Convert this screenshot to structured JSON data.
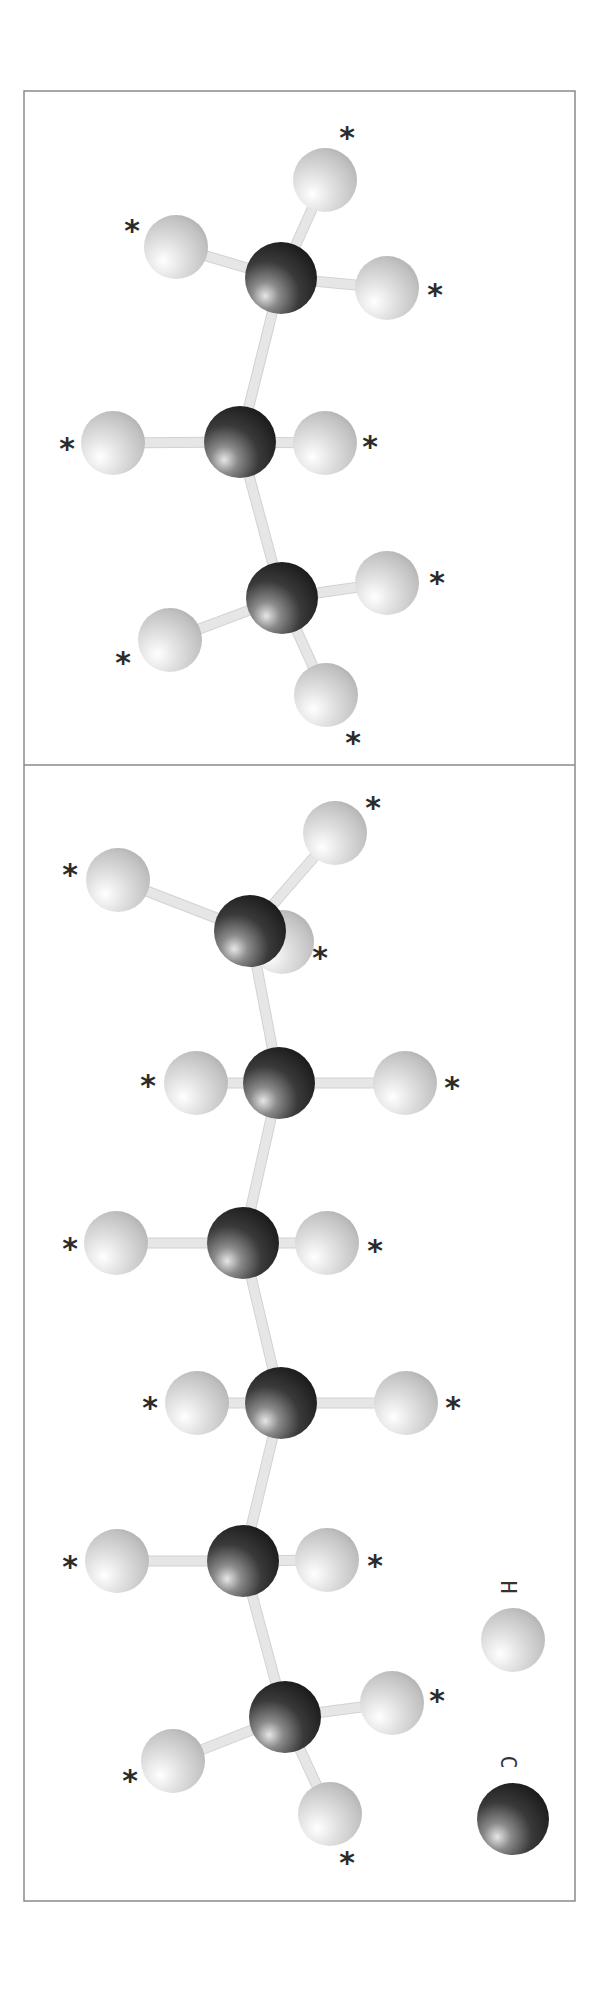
{
  "figure": {
    "colors": {
      "carbon_dark": "#1e1e1e",
      "carbon_mid": "#4a4a4a",
      "carbon_highlight": "#e0e0e0",
      "hydrogen_dark": "#b4b4b4",
      "hydrogen_mid": "#d0d0d0",
      "hydrogen_highlight": "#ffffff",
      "bond": "#e6e6e6",
      "frame": "#8a8a8a",
      "asterisk": "#2b2b2b"
    },
    "frame": {
      "x": 24,
      "y": 91,
      "width": 551,
      "height": 1810,
      "divider_y": 765
    },
    "marker_symbol": "*",
    "atom_radius": {
      "C": 36,
      "H": 32
    }
  },
  "panels": [
    {
      "name": "propane",
      "carbons": [
        {
          "x": 281,
          "y": 278
        },
        {
          "x": 240,
          "y": 442
        },
        {
          "x": 282,
          "y": 598
        }
      ],
      "hydrogens": [
        {
          "x": 325,
          "y": 180,
          "bonded_to": 0,
          "marker": {
            "x": 347,
            "y": 137
          }
        },
        {
          "x": 176,
          "y": 247,
          "bonded_to": 0,
          "marker": {
            "x": 132,
            "y": 230
          }
        },
        {
          "x": 387,
          "y": 288,
          "bonded_to": 0,
          "marker": {
            "x": 435,
            "y": 294
          }
        },
        {
          "x": 113,
          "y": 443,
          "bonded_to": 1,
          "marker": {
            "x": 67,
            "y": 448
          }
        },
        {
          "x": 325,
          "y": 443,
          "bonded_to": 1,
          "marker": {
            "x": 370,
            "y": 446
          }
        },
        {
          "x": 387,
          "y": 583,
          "bonded_to": 2,
          "marker": {
            "x": 437,
            "y": 582
          }
        },
        {
          "x": 170,
          "y": 640,
          "bonded_to": 2,
          "marker": {
            "x": 123,
            "y": 662
          }
        },
        {
          "x": 326,
          "y": 695,
          "bonded_to": 2,
          "marker": {
            "x": 353,
            "y": 742
          }
        }
      ]
    },
    {
      "name": "hexane",
      "carbons": [
        {
          "x": 250,
          "y": 931
        },
        {
          "x": 279,
          "y": 1083
        },
        {
          "x": 243,
          "y": 1243
        },
        {
          "x": 281,
          "y": 1403
        },
        {
          "x": 243,
          "y": 1561
        },
        {
          "x": 285,
          "y": 1717
        }
      ],
      "hydrogens": [
        {
          "x": 282,
          "y": 942,
          "bonded_to": 0,
          "behind": true,
          "marker": {
            "x": 320,
            "y": 957
          }
        },
        {
          "x": 335,
          "y": 833,
          "bonded_to": 0,
          "marker": {
            "x": 373,
            "y": 807
          }
        },
        {
          "x": 118,
          "y": 880,
          "bonded_to": 0,
          "marker": {
            "x": 70,
            "y": 874
          }
        },
        {
          "x": 196,
          "y": 1083,
          "bonded_to": 1,
          "marker": {
            "x": 148,
            "y": 1085
          }
        },
        {
          "x": 405,
          "y": 1083,
          "bonded_to": 1,
          "marker": {
            "x": 452,
            "y": 1087
          }
        },
        {
          "x": 116,
          "y": 1243,
          "bonded_to": 2,
          "marker": {
            "x": 70,
            "y": 1248
          }
        },
        {
          "x": 327,
          "y": 1243,
          "bonded_to": 2,
          "marker": {
            "x": 375,
            "y": 1250
          }
        },
        {
          "x": 197,
          "y": 1403,
          "bonded_to": 3,
          "marker": {
            "x": 150,
            "y": 1407
          }
        },
        {
          "x": 406,
          "y": 1403,
          "bonded_to": 3,
          "marker": {
            "x": 453,
            "y": 1407
          }
        },
        {
          "x": 117,
          "y": 1561,
          "bonded_to": 4,
          "marker": {
            "x": 70,
            "y": 1566
          }
        },
        {
          "x": 327,
          "y": 1560,
          "bonded_to": 4,
          "marker": {
            "x": 375,
            "y": 1565
          }
        },
        {
          "x": 392,
          "y": 1703,
          "bonded_to": 5,
          "marker": {
            "x": 437,
            "y": 1700
          }
        },
        {
          "x": 173,
          "y": 1761,
          "bonded_to": 5,
          "marker": {
            "x": 130,
            "y": 1780
          }
        },
        {
          "x": 330,
          "y": 1814,
          "bonded_to": 5,
          "marker": {
            "x": 347,
            "y": 1862
          }
        }
      ]
    }
  ],
  "legend": {
    "items": [
      {
        "element": "H",
        "label": "H",
        "ball": {
          "x": 513,
          "y": 1640
        },
        "label_pos": {
          "x": 508,
          "y": 1587
        }
      },
      {
        "element": "C",
        "label": "C",
        "ball": {
          "x": 513,
          "y": 1819
        },
        "label_pos": {
          "x": 508,
          "y": 1762
        }
      }
    ]
  }
}
